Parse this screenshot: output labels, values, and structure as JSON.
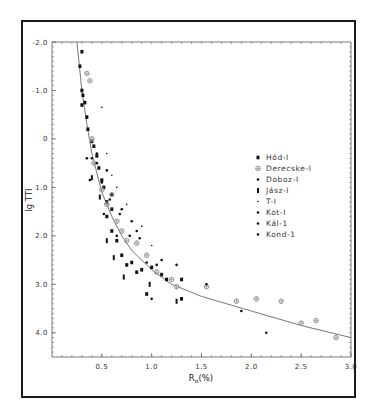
{
  "chart_data": {
    "type": "scatter",
    "title": "",
    "xlabel": "Ro(%)",
    "xlabel_main": "R",
    "xlabel_sub": "o",
    "xlabel_suffix": "(%)",
    "ylabel": "lg TTI",
    "xlim": [
      0,
      3.0
    ],
    "ylim": [
      -2.0,
      4.5
    ],
    "y_inverted": true,
    "x_ticks": [
      0.5,
      1.0,
      1.5,
      2.0,
      2.5,
      3.0
    ],
    "x_tick_labels": [
      "0.5",
      "1.0",
      "1.5",
      "2.0",
      "2.5",
      "3.0"
    ],
    "y_ticks": [
      -2.0,
      -1.0,
      0,
      1.0,
      2.0,
      3.0,
      4.0
    ],
    "y_tick_labels": [
      "-2.0",
      "-1.0",
      "0",
      "1.0",
      "2.0",
      "3.0",
      "4.0"
    ],
    "grid": false,
    "legend_position": "right-center",
    "legend": [
      "Hód-I",
      "Derecske-I",
      "Doboz-I",
      "Jász-I",
      "T-I",
      "Kot-I",
      "Kál-1",
      "Kond-1"
    ],
    "fit_curve": {
      "x": [
        0.25,
        0.3,
        0.35,
        0.4,
        0.5,
        0.6,
        0.7,
        0.8,
        1.0,
        1.2,
        1.5,
        2.0,
        2.5,
        3.0
      ],
      "y": [
        -2.0,
        -1.0,
        -0.3,
        0.3,
        1.1,
        1.6,
        2.0,
        2.3,
        2.7,
        3.0,
        3.25,
        3.55,
        3.85,
        4.1
      ]
    },
    "series": [
      {
        "name": "Hód-I",
        "marker": "square",
        "points": [
          [
            0.3,
            -1.8
          ],
          [
            0.28,
            -1.5
          ],
          [
            0.3,
            -1.0
          ],
          [
            0.31,
            -0.9
          ],
          [
            0.33,
            -0.75
          ],
          [
            0.3,
            -0.7
          ],
          [
            0.35,
            -0.45
          ],
          [
            0.36,
            -0.2
          ],
          [
            0.4,
            0.05
          ],
          [
            0.42,
            0.15
          ],
          [
            0.45,
            0.35
          ],
          [
            0.47,
            0.6
          ],
          [
            0.5,
            0.85
          ],
          [
            0.52,
            1.0
          ],
          [
            0.55,
            1.3
          ],
          [
            0.55,
            1.6
          ],
          [
            0.6,
            1.45
          ],
          [
            0.6,
            1.9
          ],
          [
            0.65,
            2.1
          ],
          [
            0.7,
            2.4
          ],
          [
            0.75,
            2.6
          ],
          [
            0.8,
            2.55
          ],
          [
            0.85,
            2.75
          ],
          [
            0.9,
            2.7
          ],
          [
            1.0,
            2.65
          ],
          [
            0.95,
            3.2
          ],
          [
            1.1,
            2.8
          ],
          [
            1.15,
            2.9
          ],
          [
            1.3,
            2.9
          ],
          [
            1.3,
            3.3
          ]
        ]
      },
      {
        "name": "Derecske-I",
        "marker": "circle-plus",
        "points": [
          [
            0.35,
            -1.35
          ],
          [
            0.38,
            -1.2
          ],
          [
            0.4,
            0.0
          ],
          [
            0.42,
            0.5
          ],
          [
            0.5,
            1.05
          ],
          [
            0.55,
            1.35
          ],
          [
            0.6,
            1.15
          ],
          [
            0.65,
            1.7
          ],
          [
            0.7,
            1.9
          ],
          [
            0.75,
            2.1
          ],
          [
            0.85,
            2.15
          ],
          [
            0.95,
            2.4
          ],
          [
            1.05,
            2.75
          ],
          [
            1.2,
            2.9
          ],
          [
            1.25,
            3.05
          ],
          [
            1.55,
            3.05
          ],
          [
            1.85,
            3.35
          ],
          [
            2.05,
            3.3
          ],
          [
            2.3,
            3.35
          ],
          [
            2.5,
            3.8
          ],
          [
            2.65,
            3.75
          ],
          [
            2.85,
            4.1
          ]
        ]
      },
      {
        "name": "Doboz-I",
        "marker": "dot",
        "points": [
          [
            0.45,
            0.3
          ],
          [
            0.5,
            0.9
          ],
          [
            0.58,
            1.25
          ],
          [
            0.68,
            1.55
          ],
          [
            0.78,
            2.0
          ],
          [
            0.88,
            2.05
          ],
          [
            1.05,
            2.6
          ]
        ]
      },
      {
        "name": "Jász-I",
        "marker": "bar",
        "points": [
          [
            0.4,
            0.8
          ],
          [
            0.48,
            1.2
          ],
          [
            0.55,
            2.1
          ],
          [
            0.62,
            2.45
          ],
          [
            0.72,
            2.85
          ],
          [
            0.98,
            3.0
          ],
          [
            1.25,
            3.35
          ]
        ]
      },
      {
        "name": "T-I",
        "marker": "small-dot",
        "points": [
          [
            0.5,
            -0.65
          ],
          [
            0.55,
            0.3
          ],
          [
            0.6,
            0.75
          ],
          [
            0.65,
            1.0
          ],
          [
            0.75,
            1.35
          ],
          [
            0.9,
            1.8
          ],
          [
            1.0,
            2.2
          ]
        ]
      },
      {
        "name": "Kot-I",
        "marker": "dot",
        "points": [
          [
            0.35,
            0.4
          ],
          [
            0.4,
            0.4
          ],
          [
            0.45,
            0.5
          ],
          [
            0.55,
            0.65
          ],
          [
            0.8,
            1.7
          ],
          [
            1.1,
            2.5
          ]
        ]
      },
      {
        "name": "Kál-1",
        "marker": "dot",
        "points": [
          [
            0.6,
            1.15
          ],
          [
            0.7,
            1.45
          ],
          [
            0.85,
            1.9
          ],
          [
            1.0,
            3.3
          ],
          [
            1.9,
            3.55
          ],
          [
            2.15,
            4.0
          ]
        ]
      },
      {
        "name": "Kond-1",
        "marker": "dot",
        "points": [
          [
            0.38,
            0.85
          ],
          [
            0.52,
            1.55
          ],
          [
            0.65,
            2.0
          ],
          [
            0.95,
            2.55
          ],
          [
            1.25,
            2.6
          ],
          [
            1.55,
            3.0
          ]
        ]
      }
    ],
    "colors": {
      "frame": "#1a1a1a",
      "axis": "#555555",
      "curve": "#666666",
      "marker_dark": "#111111",
      "marker_light": "#999999"
    }
  }
}
